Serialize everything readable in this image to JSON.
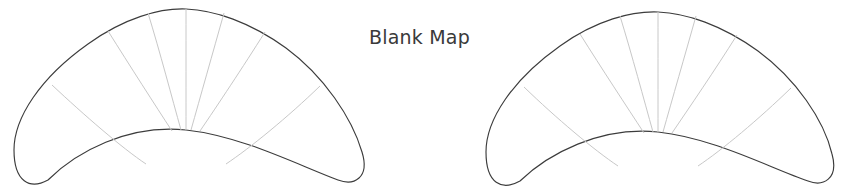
{
  "canvas": {
    "width": 842,
    "height": 193,
    "background_color": "#ffffff"
  },
  "caption": {
    "text": "Blank Map",
    "color": "#3a3a3a"
  },
  "figures": [
    {
      "id": "map-left",
      "name": "blank-map-outline-left",
      "shape": "crescent",
      "outline_color": "#3c3c3c",
      "fill_color": "#ffffff",
      "divider_color": "#c8c8c8",
      "divider_count": 7,
      "label": ""
    },
    {
      "id": "map-right",
      "name": "blank-map-outline-right",
      "shape": "crescent",
      "outline_color": "#3c3c3c",
      "fill_color": "#ffffff",
      "divider_color": "#c8c8c8",
      "divider_count": 7,
      "label": ""
    }
  ]
}
